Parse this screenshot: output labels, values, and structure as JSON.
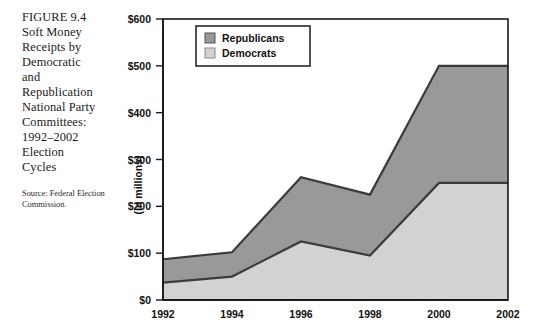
{
  "figure": {
    "title": "FIGURE 9.4\nSoft Money\nReceipts by\nDemocratic\nand\nRepublication\nNational Party\nCommittees:\n1992–2002\nElection\nCycles",
    "source": "Source: Federal Election Commission."
  },
  "colors": {
    "republican_fill": "#999999",
    "democrat_fill": "#d2d2d2",
    "line": "#3b3b3b",
    "axis": "#1a1a1a",
    "background": "#ffffff",
    "text": "#111111"
  },
  "chart_data": {
    "type": "area",
    "stacked": true,
    "title": "Soft Money Receipts by Democratic and Republication National Party Committees: 1992–2002 Election Cycles",
    "xlabel": "",
    "ylabel": "(in millions)",
    "categories": [
      "1992",
      "1994",
      "1996",
      "1998",
      "2000",
      "2002"
    ],
    "x": [
      1992,
      1994,
      1996,
      1998,
      2000,
      2002
    ],
    "series": [
      {
        "name": "Democrats",
        "values": [
          37,
          50,
          125,
          95,
          250,
          250
        ]
      },
      {
        "name": "Republicans",
        "values": [
          50,
          52,
          137,
          130,
          250,
          250
        ]
      }
    ],
    "cumulative_totals": [
      87,
      102,
      262,
      225,
      500,
      500
    ],
    "ylim": [
      0,
      600
    ],
    "yticks": [
      0,
      100,
      200,
      300,
      400,
      500,
      600
    ],
    "ytick_labels": [
      "$0",
      "$100",
      "$200",
      "$300",
      "$400",
      "$500",
      "$600"
    ],
    "xticks": [
      1992,
      1994,
      1996,
      1998,
      2000,
      2002
    ],
    "xtick_labels": [
      "1992",
      "1994",
      "1996",
      "1998",
      "2000",
      "2002"
    ],
    "grid": false,
    "legend": {
      "position": "top-left-inside",
      "entries": [
        {
          "label": "Republicans",
          "swatch": "#999999"
        },
        {
          "label": "Democrats",
          "swatch": "#d2d2d2"
        }
      ]
    }
  }
}
